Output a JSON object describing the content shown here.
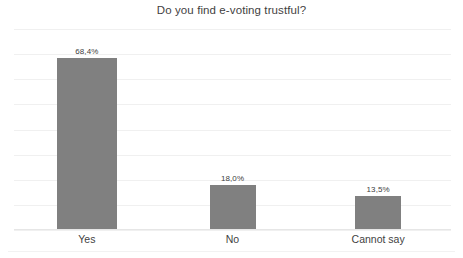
{
  "chart_data": {
    "type": "bar",
    "title": "Do you find e-voting trustful?",
    "categories": [
      "Yes",
      "No",
      "Cannot say"
    ],
    "values": [
      68.4,
      18.0,
      13.5
    ],
    "value_labels": [
      "68,4%",
      "18,0%",
      "13,5%"
    ],
    "xlabel": "",
    "ylabel": "",
    "ylim": [
      0,
      80
    ],
    "y_tick_step": 10,
    "y_tick_labels_visible": false,
    "grid": true,
    "legend": false,
    "series": [
      {
        "name": "Responses",
        "values": [
          68.4,
          18.0,
          13.5
        ]
      }
    ]
  },
  "style": {
    "bar_color": "#808080",
    "grid_color": "#f0f0f0",
    "axis_color": "#e6e6e6",
    "title_color": "#3f3f3f",
    "label_color": "#3f3f3f",
    "value_color": "#404040",
    "background": "#ffffff"
  }
}
